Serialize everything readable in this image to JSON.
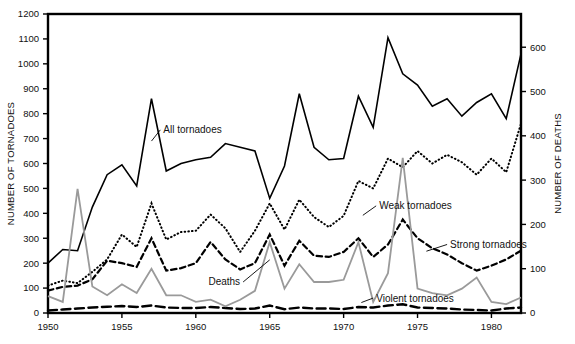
{
  "chart_data": {
    "type": "line",
    "title": "",
    "subtitle": "",
    "xlabel": "",
    "ylabel": "NUMBER OF TORNADOES",
    "y2label": "NUMBER OF DEATHS",
    "xlim": [
      1950,
      1982
    ],
    "ylim": [
      0,
      1200
    ],
    "y2lim": [
      0,
      675
    ],
    "grid": false,
    "legend_position": "inline-annotations",
    "x": [
      1950,
      1951,
      1952,
      1953,
      1954,
      1955,
      1956,
      1957,
      1958,
      1959,
      1960,
      1961,
      1962,
      1963,
      1964,
      1965,
      1966,
      1967,
      1968,
      1969,
      1970,
      1971,
      1972,
      1973,
      1974,
      1975,
      1976,
      1977,
      1978,
      1979,
      1980,
      1981,
      1982
    ],
    "xticks": [
      1950,
      1955,
      1960,
      1965,
      1970,
      1975,
      1980
    ],
    "xtick_labels": [
      "1950",
      "1955",
      "1960",
      "1965",
      "1970",
      "1975",
      "1980"
    ],
    "yticks": [
      0,
      100,
      200,
      300,
      400,
      500,
      600,
      700,
      800,
      900,
      1000,
      1100,
      1200
    ],
    "ytick_labels": [
      "0",
      "100",
      "200",
      "300",
      "400",
      "500",
      "600",
      "700",
      "800",
      "900",
      "1000",
      "1100",
      "1200"
    ],
    "y2ticks": [
      0,
      100,
      200,
      300,
      400,
      500,
      600
    ],
    "y2tick_labels": [
      "0",
      "100",
      "200",
      "300",
      "400",
      "500",
      "600"
    ],
    "series": [
      {
        "name": "All tornadoes",
        "axis": "left",
        "style": "solid",
        "color": "#000000",
        "width": 1.6,
        "label_x": 1957.6,
        "label_y": 735,
        "leader_from": [
          1957.0,
          690
        ],
        "values": [
          200,
          255,
          250,
          425,
          555,
          595,
          510,
          860,
          570,
          600,
          615,
          625,
          680,
          665,
          650,
          460,
          590,
          880,
          665,
          615,
          620,
          870,
          745,
          1105,
          960,
          915,
          830,
          860,
          790,
          845,
          880,
          780,
          1040
        ]
      },
      {
        "name": "Weak tornadoes",
        "axis": "left",
        "style": "dotted",
        "color": "#000000",
        "width": 2.0,
        "label_x": 1972.2,
        "label_y": 430,
        "leader_from": [
          1971.3,
          392
        ],
        "values": [
          110,
          130,
          120,
          165,
          215,
          315,
          265,
          440,
          295,
          325,
          330,
          395,
          340,
          245,
          330,
          440,
          335,
          455,
          385,
          345,
          390,
          530,
          500,
          620,
          585,
          650,
          600,
          635,
          605,
          555,
          620,
          565,
          760
        ]
      },
      {
        "name": "Strong tornadoes",
        "axis": "left",
        "style": "dashed",
        "color": "#000000",
        "width": 2.2,
        "label_x": 1977.0,
        "label_y": 275,
        "leader_from": [
          1975.6,
          248
        ],
        "values": [
          90,
          105,
          110,
          135,
          210,
          200,
          185,
          300,
          170,
          180,
          200,
          285,
          215,
          175,
          200,
          315,
          190,
          290,
          230,
          225,
          245,
          300,
          225,
          275,
          375,
          300,
          260,
          235,
          200,
          170,
          190,
          215,
          250
        ]
      },
      {
        "name": "Violent tornadoes",
        "axis": "left",
        "style": "long-dashed",
        "color": "#000000",
        "width": 2.4,
        "label_x": 1972.0,
        "label_y": 60,
        "leader_from": [
          1971.2,
          42
        ],
        "values": [
          10,
          14,
          18,
          22,
          25,
          28,
          24,
          30,
          22,
          20,
          20,
          24,
          20,
          16,
          18,
          30,
          15,
          22,
          18,
          18,
          16,
          24,
          22,
          30,
          35,
          22,
          20,
          18,
          14,
          12,
          10,
          18,
          22
        ]
      },
      {
        "name": "Deaths",
        "axis": "right",
        "style": "solid",
        "color": "#9a9a9a",
        "width": 1.8,
        "label_x": 1963.2,
        "label_y": 70,
        "leader_from": [
          1965.0,
          120
        ],
        "values": [
          38,
          25,
          280,
          60,
          40,
          65,
          45,
          100,
          40,
          40,
          25,
          30,
          15,
          30,
          50,
          160,
          55,
          110,
          70,
          70,
          75,
          160,
          25,
          90,
          350,
          55,
          45,
          40,
          55,
          80,
          25,
          20,
          35
        ]
      }
    ]
  },
  "annotations": {
    "all_tornadoes": "All tornadoes",
    "weak_tornadoes": "Weak tornadoes",
    "strong_tornadoes": "Strong tornadoes",
    "violent_tornadoes": "Violent tornadoes",
    "deaths": "Deaths"
  },
  "axes": {
    "left_title": "NUMBER OF TORNADOES",
    "right_title": "NUMBER OF DEATHS"
  }
}
